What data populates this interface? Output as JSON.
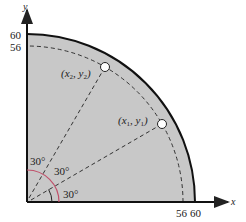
{
  "diagram": {
    "type": "quarter-circle-geometry",
    "axes": {
      "x_label": "x",
      "y_label": "y",
      "x_ticks": [
        "56",
        "60"
      ],
      "y_ticks": [
        "60",
        "56"
      ]
    },
    "outer_radius": 60,
    "dashed_radius": 56,
    "points": [
      {
        "label": "(x₁, y₁)",
        "x_text": "x",
        "x_sub": "1",
        "y_text": "y",
        "y_sub": "1",
        "angle_deg": 30
      },
      {
        "label": "(x₂, y₂)",
        "x_text": "x",
        "x_sub": "2",
        "y_text": "y",
        "y_sub": "2",
        "angle_deg": 60
      }
    ],
    "angle_labels": [
      "30°",
      "30°",
      "30°"
    ],
    "colors": {
      "fill": "#c8c8c8",
      "outline": "#111111",
      "dash": "#333333",
      "angle_arc": "#c0506a"
    }
  }
}
